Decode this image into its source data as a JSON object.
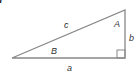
{
  "figure": {
    "title_visible": "re 7"
  },
  "triangle": {
    "type": "right triangle",
    "right_angle_at": "bottom-right",
    "labels": {
      "hypotenuse": "c",
      "base": "a",
      "height": "b",
      "angle_top": "A",
      "angle_left": "B"
    },
    "stroke_color": "#888888"
  }
}
